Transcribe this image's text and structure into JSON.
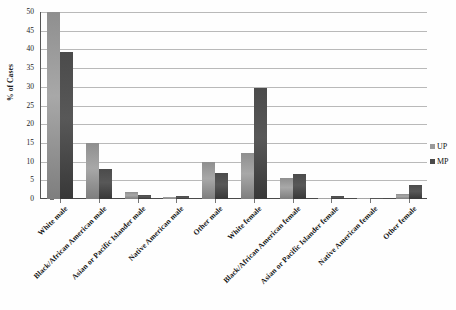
{
  "chart_data": {
    "type": "bar",
    "title": "",
    "xlabel": "",
    "ylabel": "% of Cases",
    "ylim": [
      0,
      50
    ],
    "ytick_step": 5,
    "grid": true,
    "legend_position": "right",
    "categories": [
      "White male",
      "Black/African American male",
      "Asian or Pacific Islander male",
      "Native American male",
      "Other male",
      "White female",
      "Black/African American female",
      "Asian or Pacific Islander female",
      "Native American female",
      "Other female"
    ],
    "series": [
      {
        "name": "UP",
        "color": "#9a9a9a",
        "values": [
          50.0,
          14.9,
          1.8,
          0.5,
          9.8,
          12.3,
          5.6,
          0.2,
          0.05,
          1.4
        ]
      },
      {
        "name": "MP",
        "color": "#4a4a4a",
        "values": [
          39.3,
          8.0,
          1.0,
          0.7,
          6.9,
          29.6,
          6.6,
          0.7,
          0.3,
          3.7
        ]
      }
    ],
    "ytick_labels": [
      "0",
      "5",
      "10",
      "15",
      "20",
      "25",
      "30",
      "35",
      "40",
      "45",
      "50"
    ]
  },
  "axis": {
    "y_title": "% of Cases"
  },
  "legend": {
    "items": [
      {
        "label": "UP",
        "swatch": "up-swatch-icon"
      },
      {
        "label": "MP",
        "swatch": "mp-swatch-icon"
      }
    ]
  }
}
